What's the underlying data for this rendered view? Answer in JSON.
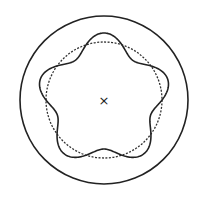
{
  "diagram": {
    "center": {
      "x": 104,
      "y": 100
    },
    "center_marker": {
      "symbol": "×"
    },
    "outer_circle": {
      "radius": 84,
      "style": "solid",
      "color": "#222222"
    },
    "reference_circle": {
      "radius": 58,
      "style": "dashed",
      "color": "#333333"
    },
    "wavy_curve": {
      "base_radius": 58,
      "amplitude": 9,
      "lobes": 5,
      "phase_deg": -90,
      "style": "solid",
      "color": "#222222"
    }
  }
}
